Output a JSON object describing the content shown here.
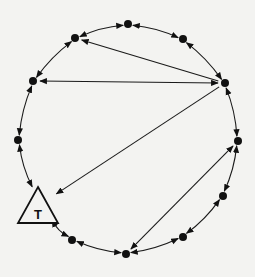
{
  "diagram": {
    "type": "ring-network",
    "background": "#f3f3f1",
    "terminal_label": "T",
    "nodes": [
      {
        "id": "n_top",
        "x": 128,
        "y": 24
      },
      {
        "id": "n_upper_right",
        "x": 183,
        "y": 39
      },
      {
        "id": "n_right",
        "x": 225,
        "y": 83
      },
      {
        "id": "n_right_lower",
        "x": 238,
        "y": 141
      },
      {
        "id": "n_right_bottom",
        "x": 223,
        "y": 196
      },
      {
        "id": "n_bottom_right",
        "x": 183,
        "y": 237
      },
      {
        "id": "n_bottom",
        "x": 126,
        "y": 254
      },
      {
        "id": "n_bottom_left",
        "x": 72,
        "y": 240
      },
      {
        "id": "T",
        "x": 38,
        "y": 206,
        "shape": "triangle",
        "label": "T"
      },
      {
        "id": "n_left_lower",
        "x": 18,
        "y": 140
      },
      {
        "id": "n_left_upper",
        "x": 33,
        "y": 81
      },
      {
        "id": "n_upper_left",
        "x": 75,
        "y": 38
      }
    ],
    "ring_edges": "bidirectional arrows between each adjacent pair around the circle",
    "chords": [
      {
        "from": "n_right",
        "to": "n_upper_left",
        "direction": "to"
      },
      {
        "from": "n_right",
        "to": "n_left_upper",
        "direction": "both"
      },
      {
        "from": "n_right",
        "to": "T",
        "direction": "to"
      },
      {
        "from": "n_right_lower",
        "to": "n_bottom",
        "direction": "both"
      }
    ]
  }
}
